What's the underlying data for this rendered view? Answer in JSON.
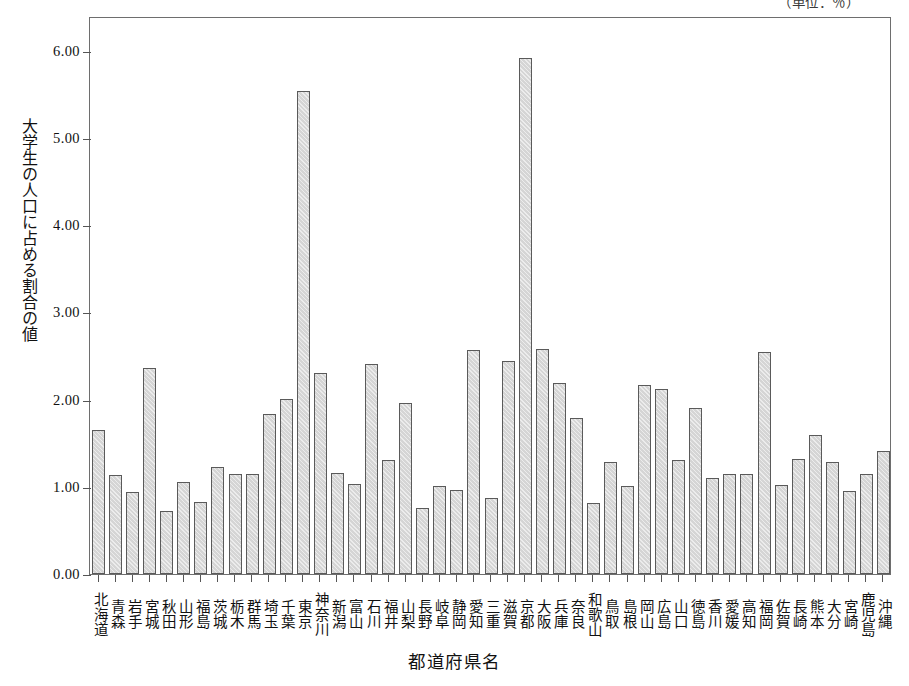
{
  "chart_data": {
    "type": "bar",
    "title": "",
    "unit_note": "（単位：％）",
    "xlabel": "都道府県名",
    "ylabel": "大学生の人口に占める割合の値",
    "ylim": [
      0,
      6.4
    ],
    "ytick_values": [
      0,
      1,
      2,
      3,
      4,
      5,
      6
    ],
    "ytick_labels": [
      "0.00",
      "1.00",
      "2.00",
      "3.00",
      "4.00",
      "5.00",
      "6.00"
    ],
    "grid": false,
    "legend": "none",
    "bar_fill_color": "#d5d5d5",
    "bar_edge_color": "#5a5a5a",
    "categories": [
      "北海道",
      "青森",
      "岩手",
      "宮城",
      "秋田",
      "山形",
      "福島",
      "茨城",
      "栃木",
      "群馬",
      "埼玉",
      "千葉",
      "東京",
      "神奈川",
      "新潟",
      "富山",
      "石川",
      "福井",
      "山梨",
      "長野",
      "岐阜",
      "静岡",
      "愛知",
      "三重",
      "滋賀",
      "京都",
      "大阪",
      "兵庫",
      "奈良",
      "和歌山",
      "鳥取",
      "島根",
      "岡山",
      "広島",
      "山口",
      "徳島",
      "香川",
      "愛媛",
      "高知",
      "福岡",
      "佐賀",
      "長崎",
      "熊本",
      "大分",
      "宮崎",
      "鹿児島",
      "沖縄"
    ],
    "values": [
      1.65,
      1.13,
      0.94,
      2.36,
      0.72,
      1.06,
      0.83,
      1.23,
      1.15,
      1.15,
      1.84,
      2.01,
      5.54,
      2.31,
      1.16,
      1.03,
      2.41,
      1.31,
      1.96,
      0.76,
      1.01,
      0.96,
      2.57,
      0.87,
      2.44,
      5.92,
      2.58,
      2.19,
      1.79,
      0.81,
      1.29,
      1.01,
      2.17,
      2.12,
      1.31,
      1.9,
      1.1,
      1.15,
      1.15,
      2.55,
      1.02,
      1.32,
      1.6,
      1.28,
      0.95,
      1.15,
      1.41
    ]
  }
}
